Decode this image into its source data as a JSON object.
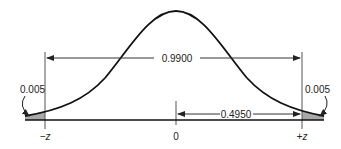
{
  "diagram": {
    "type": "normal-distribution-two-tailed",
    "labels": {
      "center_area": "0.9900",
      "half_area": "0.4950",
      "left_tail": "0.005",
      "right_tail": "0.005",
      "left_z": "−z",
      "center": "0",
      "right_z": "+z"
    },
    "colors": {
      "curve": "#111111",
      "lines": "#333333",
      "tail_fill": "#a8a8a8",
      "text": "#222222"
    }
  }
}
